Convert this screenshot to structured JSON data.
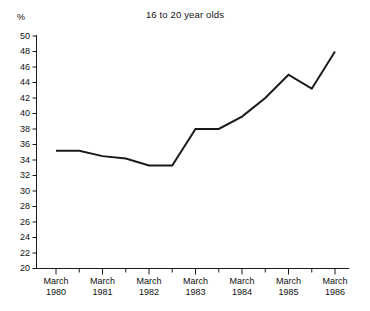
{
  "chart_data": {
    "type": "line",
    "title": "16 to 20 year olds",
    "xlabel": "",
    "ylabel": "%",
    "ylim": [
      20,
      50
    ],
    "ytick_step": 2,
    "yticks": [
      50,
      48,
      46,
      44,
      42,
      40,
      38,
      36,
      34,
      32,
      30,
      28,
      26,
      24,
      22,
      20
    ],
    "grid": false,
    "legend": null,
    "x_major_labels": [
      "March 1980",
      "March 1981",
      "March 1982",
      "March 1983",
      "March 1984",
      "March 1985",
      "March 1986"
    ],
    "x_minor_ticks_between_majors": 1,
    "categories": [
      "March 1980",
      "Sept 1980",
      "March 1981",
      "Sept 1981",
      "March 1982",
      "Sept 1982",
      "March 1983",
      "Sept 1983",
      "March 1984",
      "Sept 1984",
      "March 1985",
      "Sept 1985",
      "March 1986"
    ],
    "values": [
      35.2,
      35.2,
      34.5,
      34.2,
      33.3,
      33.3,
      38.0,
      38.0,
      39.6,
      42.0,
      45.0,
      43.2,
      48.0
    ],
    "series": [
      {
        "name": "16 to 20 year olds",
        "values": [
          35.2,
          35.2,
          34.5,
          34.2,
          33.3,
          33.3,
          38.0,
          38.0,
          39.6,
          42.0,
          45.0,
          43.2,
          48.0
        ]
      }
    ],
    "line_color": "#1a1a1a",
    "line_width": 2,
    "markers": false
  },
  "axis": {
    "y_unit_label": "%",
    "y_labels": [
      "50",
      "48",
      "46",
      "44",
      "42",
      "40",
      "38",
      "36",
      "34",
      "32",
      "30",
      "28",
      "26",
      "24",
      "22",
      "20"
    ],
    "x_labels": [
      {
        "line1": "March",
        "line2": "1980"
      },
      {
        "line1": "March",
        "line2": "1981"
      },
      {
        "line1": "March",
        "line2": "1982"
      },
      {
        "line1": "March",
        "line2": "1983"
      },
      {
        "line1": "March",
        "line2": "1984"
      },
      {
        "line1": "March",
        "line2": "1985"
      },
      {
        "line1": "March",
        "line2": "1986"
      }
    ]
  },
  "title": {
    "text": "16 to 20 year olds"
  }
}
